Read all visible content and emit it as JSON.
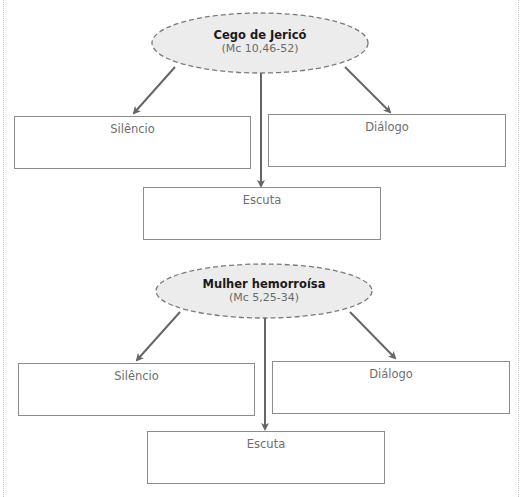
{
  "header": {
    "clipped_text": ""
  },
  "colors": {
    "ellipse_fill": "#ececec",
    "ellipse_stroke": "#7a7a7a",
    "arrow": "#666666",
    "box_border": "#8c8c8c",
    "label_text": "#6e6e6e"
  },
  "diagrams": [
    {
      "center_node": {
        "title": "Cego de Jericó",
        "reference": "(Mc 10,46-52)"
      },
      "boxes": [
        {
          "label": "Silêncio"
        },
        {
          "label": "Diálogo"
        },
        {
          "label": "Escuta"
        }
      ]
    },
    {
      "center_node": {
        "title": "Mulher hemorroísa",
        "reference": "(Mc 5,25-34)"
      },
      "boxes": [
        {
          "label": "Silêncio"
        },
        {
          "label": "Diálogo"
        },
        {
          "label": "Escuta"
        }
      ]
    }
  ]
}
